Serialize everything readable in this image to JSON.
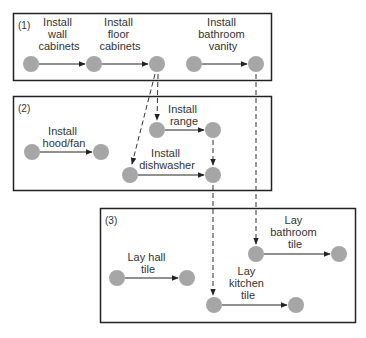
{
  "colors": {
    "node": "#a6a6a6",
    "frame": "#222222",
    "edge": "#222222",
    "dashed": "#333333",
    "text": "#333333"
  },
  "groups": [
    {
      "id": "g1",
      "label": "(1)"
    },
    {
      "id": "g2",
      "label": "(2)"
    },
    {
      "id": "g3",
      "label": "(3)"
    }
  ],
  "tasks": {
    "wall_cabinets": [
      "Install",
      "wall",
      "cabinets"
    ],
    "floor_cabinets": [
      "Install",
      "floor",
      "cabinets"
    ],
    "bathroom_vanity": [
      "Install",
      "bathroom",
      "vanity"
    ],
    "hood_fan": [
      "Install",
      "hood/fan"
    ],
    "range": [
      "Install",
      "range"
    ],
    "dishwasher": [
      "Install",
      "dishwasher"
    ],
    "hall_tile": [
      "Lay hall",
      "tile"
    ],
    "bathroom_tile": [
      "Lay",
      "bathroom",
      "tile"
    ],
    "kitchen_tile": [
      "Lay",
      "kitchen",
      "tile"
    ]
  }
}
